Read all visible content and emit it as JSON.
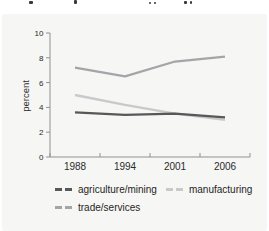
{
  "figure": {
    "note": "cropped text line at top edge (illegible, descenders only)"
  },
  "chart_data": {
    "type": "line",
    "categories": [
      "1988",
      "1994",
      "2001",
      "2006"
    ],
    "series": [
      {
        "name": "agriculture/mining",
        "values": [
          3.6,
          3.4,
          3.5,
          3.2
        ],
        "color": "#58585b"
      },
      {
        "name": "manufacturing",
        "values": [
          5.0,
          4.2,
          3.5,
          3.0
        ],
        "color": "#c8c9cb"
      },
      {
        "name": "trade/services",
        "values": [
          7.2,
          6.5,
          7.7,
          8.1
        ],
        "color": "#a3a5a8"
      }
    ],
    "title": "",
    "xlabel": "",
    "ylabel": "percent",
    "ylim": [
      0,
      10
    ],
    "yticks": [
      0,
      2,
      4,
      6,
      8,
      10
    ],
    "grid": false,
    "legend_position": "bottom",
    "panel_background": "#f6f6f4",
    "axis_color": "#8f9193"
  }
}
